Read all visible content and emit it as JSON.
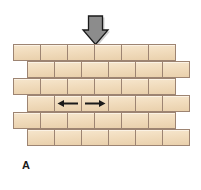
{
  "figure": {
    "label": "A",
    "background_color": "#ffffff"
  },
  "load_arrow": {
    "icon": "arrow-down-icon",
    "direction": "down",
    "fill_color": "#8c8c8c",
    "stroke_color": "#1a1a1a",
    "shadow_color": "#b3b3b3"
  },
  "wall": {
    "brick_fill_color": "#f1dcbd",
    "brick_border_color": "#9d8472",
    "brick_width": 27,
    "brick_height": 17,
    "rows": [
      {
        "offset": 13,
        "bricks": 6
      },
      {
        "offset": 27,
        "bricks": 6
      },
      {
        "offset": 13,
        "bricks": 6
      },
      {
        "offset": 27,
        "bricks": 6
      },
      {
        "offset": 13,
        "bricks": 6
      },
      {
        "offset": 27,
        "bricks": 6
      }
    ],
    "tension_arrows": [
      {
        "row": 3,
        "brick": 1,
        "icon": "arrow-left-icon",
        "direction": "left"
      },
      {
        "row": 3,
        "brick": 2,
        "icon": "arrow-right-icon",
        "direction": "right"
      }
    ],
    "tension_arrow_color": "#1a1a1a"
  }
}
